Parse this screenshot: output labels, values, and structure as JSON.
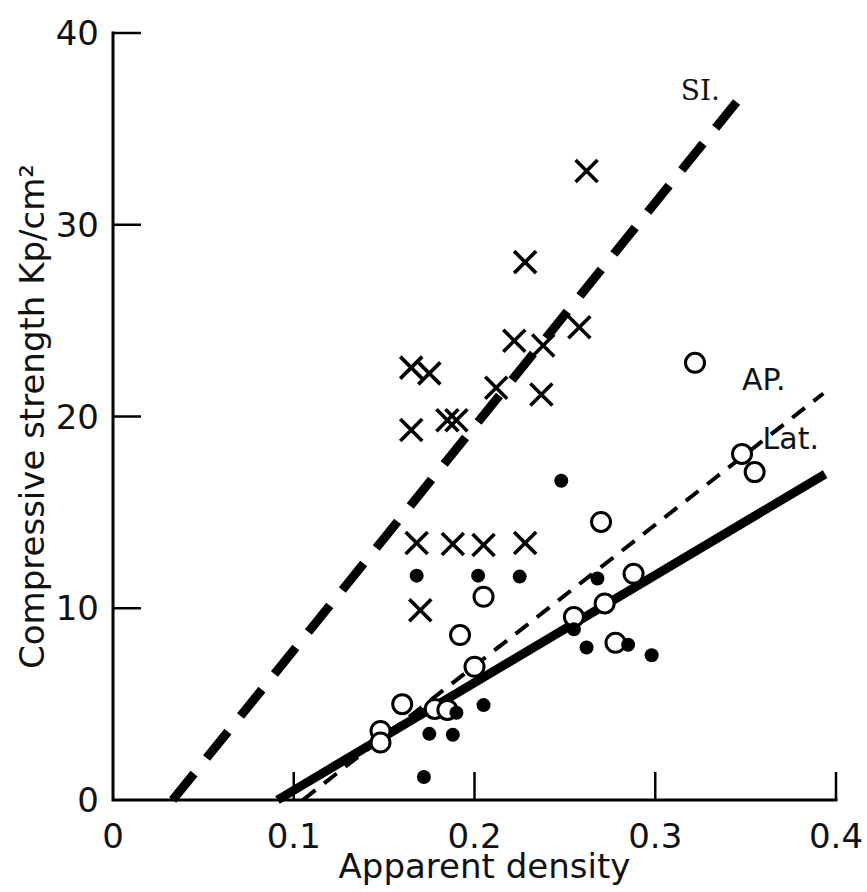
{
  "chart_data": {
    "type": "scatter",
    "title": "",
    "xlabel": "Apparent density",
    "ylabel": "Compressive strength Kp/cm²",
    "xlim": [
      0,
      0.4
    ],
    "ylim": [
      0,
      40
    ],
    "xticks": [
      0,
      0.1,
      0.2,
      0.3,
      0.4
    ],
    "xticklabels": [
      "0",
      "0.1",
      "0.2",
      "0.3",
      "0.4"
    ],
    "yticks": [
      0,
      10,
      20,
      30,
      40
    ],
    "yticklabels": [
      "0",
      "10",
      "20",
      "30",
      "40"
    ],
    "grid": false,
    "legend_position": "inline-at-line-ends",
    "series": [
      {
        "name": "SI.",
        "label": "SI.",
        "marker": "cross",
        "label_x": 0.325,
        "label_y": 36.5,
        "fit_line": {
          "style": "long-dash",
          "x0": 0.033,
          "y0": 0.0,
          "x1": 0.345,
          "y1": 36.4
        },
        "points": [
          [
            0.165,
            22.55
          ],
          [
            0.175,
            22.25
          ],
          [
            0.165,
            19.3
          ],
          [
            0.185,
            19.8
          ],
          [
            0.19,
            19.8
          ],
          [
            0.205,
            13.3
          ],
          [
            0.188,
            13.35
          ],
          [
            0.168,
            13.4
          ],
          [
            0.228,
            13.4
          ],
          [
            0.17,
            9.9
          ],
          [
            0.222,
            23.95
          ],
          [
            0.238,
            23.7
          ],
          [
            0.258,
            24.65
          ],
          [
            0.212,
            21.5
          ],
          [
            0.237,
            21.15
          ],
          [
            0.262,
            32.8
          ],
          [
            0.228,
            28.05
          ]
        ]
      },
      {
        "name": "AP.",
        "label": "AP.",
        "marker": "open-circle",
        "label_x": 0.36,
        "label_y": 21.4,
        "fit_line": {
          "style": "short-dash",
          "x0": 0.105,
          "y0": 0.0,
          "x1": 0.393,
          "y1": 21.2
        },
        "points": [
          [
            0.16,
            5.0
          ],
          [
            0.148,
            3.6
          ],
          [
            0.148,
            3.0
          ],
          [
            0.178,
            4.75
          ],
          [
            0.185,
            4.7
          ],
          [
            0.2,
            6.95
          ],
          [
            0.192,
            8.6
          ],
          [
            0.205,
            10.6
          ],
          [
            0.255,
            9.55
          ],
          [
            0.27,
            14.5
          ],
          [
            0.272,
            10.25
          ],
          [
            0.288,
            11.8
          ],
          [
            0.278,
            8.2
          ],
          [
            0.322,
            22.8
          ],
          [
            0.348,
            18.05
          ],
          [
            0.355,
            17.1
          ]
        ]
      },
      {
        "name": "Lat.",
        "label": "Lat.",
        "marker": "filled-dot",
        "label_x": 0.375,
        "label_y": 18.3,
        "fit_line": {
          "style": "solid",
          "x0": 0.091,
          "y0": 0.0,
          "x1": 0.394,
          "y1": 17.0
        },
        "points": [
          [
            0.168,
            11.7
          ],
          [
            0.19,
            4.55
          ],
          [
            0.175,
            3.45
          ],
          [
            0.188,
            3.4
          ],
          [
            0.205,
            4.95
          ],
          [
            0.172,
            1.2
          ],
          [
            0.225,
            11.65
          ],
          [
            0.248,
            16.65
          ],
          [
            0.255,
            8.9
          ],
          [
            0.268,
            11.55
          ],
          [
            0.262,
            7.95
          ],
          [
            0.285,
            8.1
          ],
          [
            0.298,
            7.55
          ],
          [
            0.202,
            11.7
          ]
        ]
      }
    ]
  },
  "axes": {
    "x_axis_name": "x-axis",
    "y_axis_name": "y-axis"
  }
}
